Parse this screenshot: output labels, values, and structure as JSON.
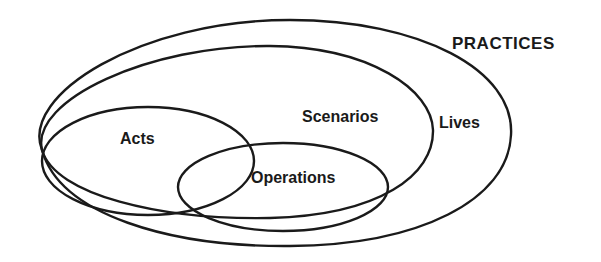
{
  "diagram": {
    "type": "nested-venn",
    "title": "PRACTICES",
    "sets": [
      {
        "label": "Lives",
        "contains": [
          "Scenarios"
        ]
      },
      {
        "label": "Scenarios",
        "contains": [
          "Acts",
          "Operations"
        ]
      },
      {
        "label": "Acts"
      },
      {
        "label": "Operations"
      }
    ],
    "overlaps": [
      [
        "Acts",
        "Operations"
      ]
    ],
    "labels": {
      "practices": "PRACTICES",
      "lives": "Lives",
      "scenarios": "Scenarios",
      "acts": "Acts",
      "operations": "Operations"
    },
    "stroke_color": "#1a1a1a",
    "background": "#ffffff"
  }
}
